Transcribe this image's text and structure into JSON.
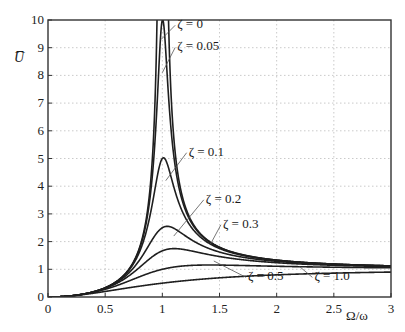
{
  "chart_data": {
    "type": "line",
    "title": "",
    "xlabel": "Ω/ω",
    "ylabel": "U̅",
    "xlim": [
      0,
      3
    ],
    "ylim": [
      0,
      10
    ],
    "grid": true,
    "legend": "inline labels",
    "x_ticks": [
      "0",
      "0.5",
      "1",
      "1.5",
      "2",
      "2.5",
      "3"
    ],
    "y_ticks": [
      "0",
      "1",
      "2",
      "3",
      "4",
      "5",
      "6",
      "7",
      "8",
      "9",
      "10"
    ],
    "x": [
      0,
      0.5,
      1.0,
      1.5,
      2.0,
      2.5,
      3.0
    ],
    "series": [
      {
        "name": "ζ = 0",
        "zeta": 0,
        "values": [
          0,
          0.333,
          10,
          1.8,
          1.333,
          1.19,
          1.125
        ]
      },
      {
        "name": "ζ = 0.05",
        "zeta": 0.05,
        "values": [
          0,
          0.333,
          10,
          1.79,
          1.33,
          1.19,
          1.125
        ]
      },
      {
        "name": "ζ = 0.1",
        "zeta": 0.1,
        "values": [
          0,
          0.331,
          5.0,
          1.78,
          1.32,
          1.19,
          1.12
        ]
      },
      {
        "name": "ζ = 0.2",
        "zeta": 0.2,
        "values": [
          0,
          0.324,
          2.5,
          1.71,
          1.3,
          1.18,
          1.12
        ]
      },
      {
        "name": "ζ = 0.3",
        "zeta": 0.3,
        "values": [
          0,
          0.311,
          1.67,
          1.58,
          1.27,
          1.16,
          1.11
        ]
      },
      {
        "name": "ζ = 0.5",
        "zeta": 0.5,
        "values": [
          0,
          0.277,
          1.0,
          1.28,
          1.17,
          1.11,
          1.08
        ]
      },
      {
        "name": "ζ = 1.0",
        "zeta": 1.0,
        "values": [
          0,
          0.2,
          0.5,
          0.69,
          0.8,
          0.86,
          0.9
        ]
      }
    ],
    "annotations": [
      {
        "text": "ζ = 0",
        "x": 1.13,
        "y": 9.7,
        "pointer_to": [
          0.99,
          9.3
        ]
      },
      {
        "text": "ζ = 0.05",
        "x": 1.13,
        "y": 8.9,
        "pointer_to": [
          1.0,
          8.1
        ]
      },
      {
        "text": "ζ = 0.1",
        "x": 1.23,
        "y": 5.1,
        "pointer_to": [
          1.03,
          4.2
        ]
      },
      {
        "text": "ζ = 0.2",
        "x": 1.38,
        "y": 3.4,
        "pointer_to": [
          1.1,
          2.2
        ]
      },
      {
        "text": "ζ = 0.3",
        "x": 1.53,
        "y": 2.5,
        "pointer_to": [
          1.42,
          1.9
        ]
      },
      {
        "text": "ζ = 0.5",
        "x": 1.75,
        "y": 0.6,
        "pointer_to": [
          1.45,
          1.3
        ]
      },
      {
        "text": "ζ = 1.0",
        "x": 2.33,
        "y": 0.6,
        "pointer_to": [
          2.2,
          1.1
        ]
      }
    ]
  },
  "colors": {
    "curve": "#1f1f1f",
    "grid": "#bdbdbd",
    "frame": "#333333",
    "pointer": "#555555"
  }
}
